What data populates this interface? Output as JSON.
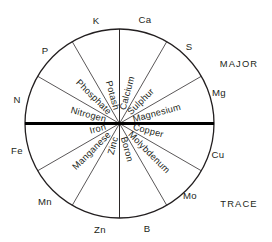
{
  "diagram": {
    "geometry": {
      "center_x": 119.5,
      "center_y": 123.5,
      "radius": 94.5,
      "segment_count": 12,
      "segment_span_degrees": 30
    },
    "colors": {
      "ink": "#231f20",
      "divider": "#000000",
      "background": "#ffffff"
    },
    "categories": [
      {
        "key": "major",
        "label": "MAJOR",
        "x": 239,
        "y": 65
      },
      {
        "key": "trace",
        "label": "TRACE",
        "x": 239,
        "y": 205
      }
    ],
    "segments": [
      {
        "label": "Nitrogen",
        "symbol": "N",
        "category": "major",
        "start_deg": 150,
        "end_deg": 180
      },
      {
        "label": "Phosphate",
        "symbol": "P",
        "category": "major",
        "start_deg": 120,
        "end_deg": 150
      },
      {
        "label": "Potash",
        "symbol": "K",
        "category": "major",
        "start_deg": 90,
        "end_deg": 120
      },
      {
        "label": "Calcium",
        "symbol": "Ca",
        "category": "major",
        "start_deg": 60,
        "end_deg": 90
      },
      {
        "label": "Sulphur",
        "symbol": "S",
        "category": "major",
        "start_deg": 30,
        "end_deg": 60
      },
      {
        "label": "Magnesium",
        "symbol": "Mg",
        "category": "major",
        "start_deg": 0,
        "end_deg": 30
      },
      {
        "label": "Copper",
        "symbol": "Cu",
        "category": "trace",
        "start_deg": -30,
        "end_deg": 0
      },
      {
        "label": "Molybdenum",
        "symbol": "Mo",
        "category": "trace",
        "start_deg": -60,
        "end_deg": -30
      },
      {
        "label": "Boron",
        "symbol": "B",
        "category": "trace",
        "start_deg": -90,
        "end_deg": -60
      },
      {
        "label": "Zinc",
        "symbol": "Zn",
        "category": "trace",
        "start_deg": -120,
        "end_deg": -90
      },
      {
        "label": "Manganese",
        "symbol": "Mn",
        "category": "trace",
        "start_deg": -150,
        "end_deg": -120
      },
      {
        "label": "Iron",
        "symbol": "Fe",
        "category": "trace",
        "start_deg": -180,
        "end_deg": -150
      }
    ],
    "rim_labels": [
      {
        "text": "K",
        "x": 96,
        "y": 21
      },
      {
        "text": "Ca",
        "x": 145,
        "y": 20
      },
      {
        "text": "S",
        "x": 189,
        "y": 47
      },
      {
        "text": "Mg",
        "x": 219,
        "y": 93
      },
      {
        "text": "Cu",
        "x": 218,
        "y": 155
      },
      {
        "text": "Mo",
        "x": 190,
        "y": 196
      },
      {
        "text": "B",
        "x": 147,
        "y": 229
      },
      {
        "text": "Zn",
        "x": 100,
        "y": 230
      },
      {
        "text": "Mn",
        "x": 45,
        "y": 202
      },
      {
        "text": "Fe",
        "x": 17,
        "y": 151
      },
      {
        "text": "N",
        "x": 17,
        "y": 100
      },
      {
        "text": "P",
        "x": 45,
        "y": 51
      }
    ]
  }
}
